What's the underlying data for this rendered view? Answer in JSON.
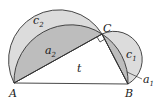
{
  "diagram": {
    "points": [
      {
        "name": "A",
        "x": 14,
        "y": 83
      },
      {
        "name": "B",
        "x": 128,
        "y": 84
      },
      {
        "name": "C",
        "x": 102,
        "y": 34
      }
    ],
    "labels": {
      "A": "A",
      "B": "B",
      "C": "C",
      "t": "t",
      "c1": "c",
      "c1_sub": "1",
      "c2": "c",
      "c2_sub": "2",
      "a1": "a",
      "a1_sub": "1",
      "a2": "a",
      "a2_sub": "2"
    },
    "colors": {
      "lune_fill": "#dcdcdc",
      "segment_fill": "#bdbdbd",
      "stroke": "#333333",
      "background": "#ffffff"
    }
  }
}
